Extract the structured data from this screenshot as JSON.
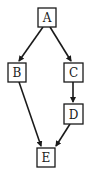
{
  "diagram": {
    "type": "directed-graph",
    "colors": {
      "stroke": "#1a1a1a",
      "fill": "#ffffff",
      "background": "#ffffff"
    },
    "nodes": [
      {
        "id": "A",
        "label": "A",
        "x": 38,
        "y": 8,
        "w": 18,
        "h": 19
      },
      {
        "id": "B",
        "label": "B",
        "x": 8,
        "y": 63,
        "w": 18,
        "h": 19
      },
      {
        "id": "C",
        "label": "C",
        "x": 64,
        "y": 63,
        "w": 19,
        "h": 19
      },
      {
        "id": "D",
        "label": "D",
        "x": 64,
        "y": 104,
        "w": 19,
        "h": 20
      },
      {
        "id": "E",
        "label": "E",
        "x": 37,
        "y": 148,
        "w": 18,
        "h": 19
      }
    ],
    "edges": [
      {
        "from": "A",
        "to": "B",
        "x1": 43,
        "y1": 27,
        "x2": 19,
        "y2": 61
      },
      {
        "from": "A",
        "to": "C",
        "x1": 50,
        "y1": 27,
        "x2": 71,
        "y2": 61
      },
      {
        "from": "C",
        "to": "D",
        "x1": 73,
        "y1": 82,
        "x2": 73,
        "y2": 102
      },
      {
        "from": "B",
        "to": "E",
        "x1": 19,
        "y1": 82,
        "x2": 41,
        "y2": 146
      },
      {
        "from": "D",
        "to": "E",
        "x1": 70,
        "y1": 124,
        "x2": 56,
        "y2": 146
      }
    ]
  }
}
